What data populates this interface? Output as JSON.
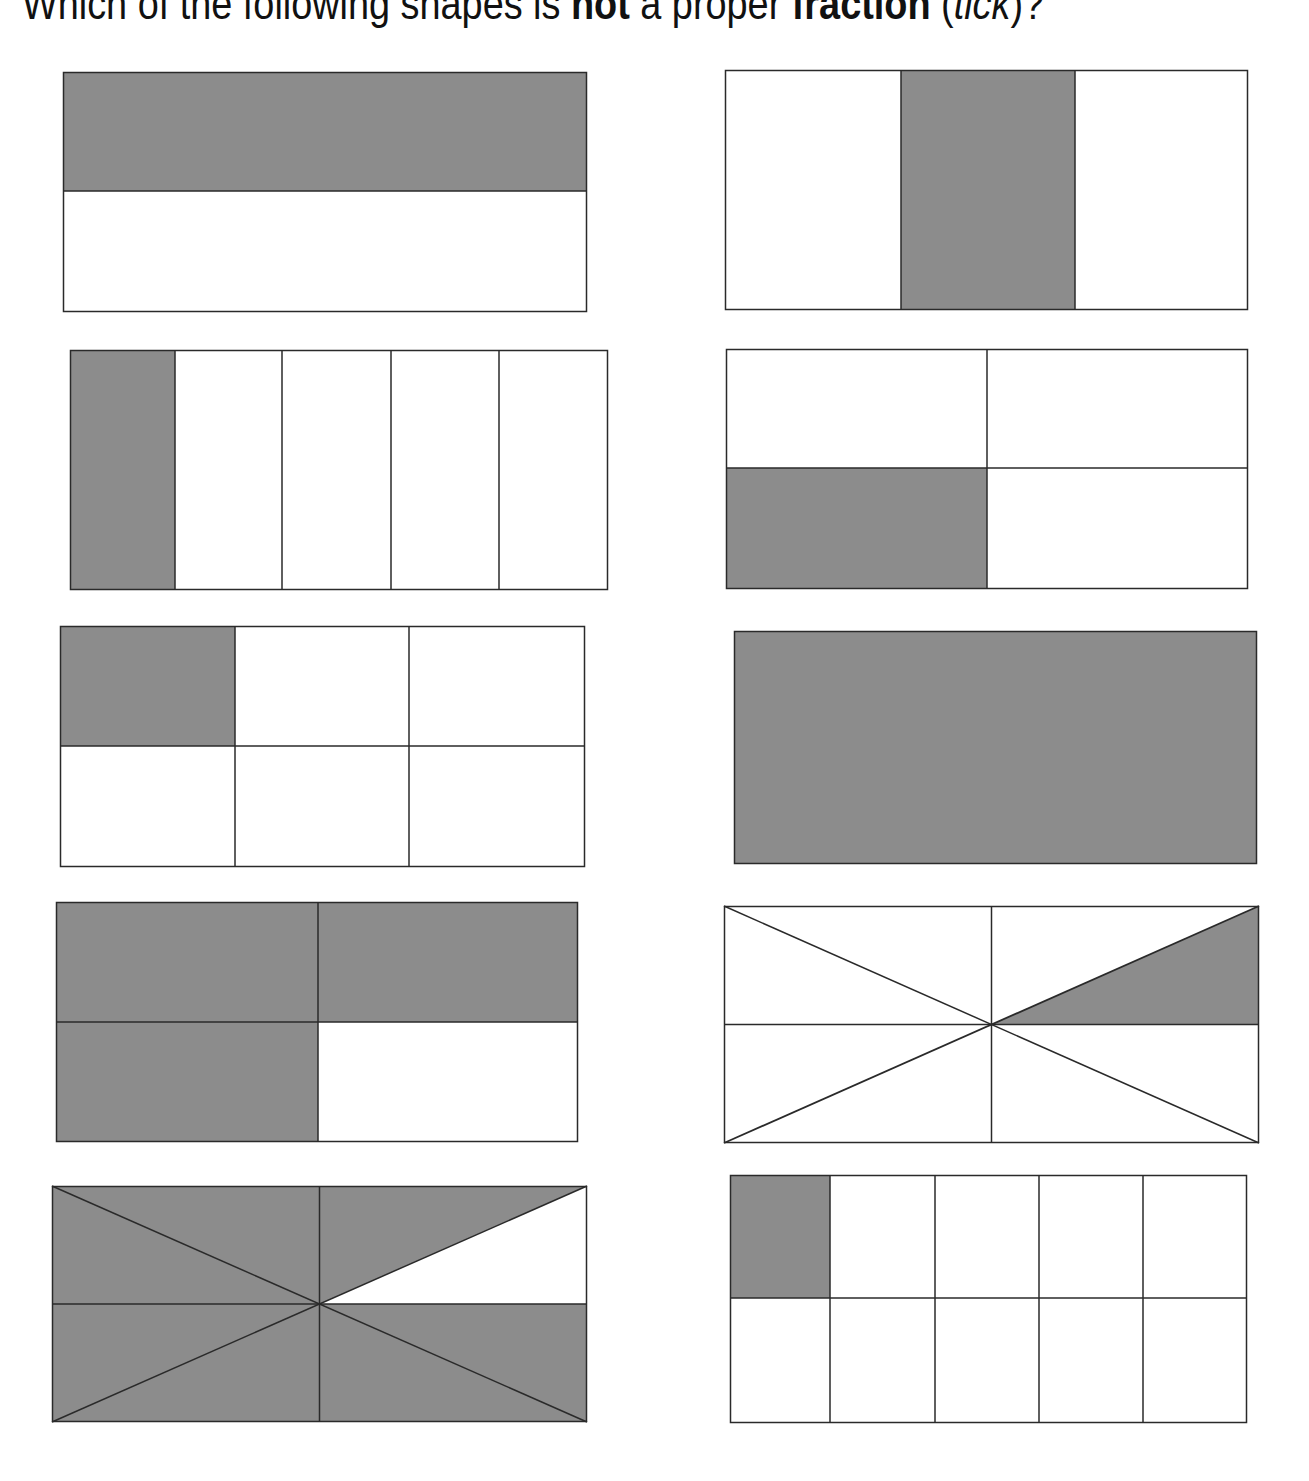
{
  "question": {
    "part1": "Which of the following shapes is ",
    "bold1": "not",
    "part2": " a proper ",
    "bold2": "fraction",
    "part3": " (",
    "italic": "tick",
    "part4": ")?"
  },
  "colors": {
    "shade": "#8c8c8c",
    "line": "#2a2a2a",
    "background": "#ffffff"
  },
  "shapes": [
    {
      "id": 1,
      "description": "rectangle split into 2 horizontal halves, top half shaded",
      "parts": 2,
      "shaded": 1,
      "fraction": "1/2"
    },
    {
      "id": 2,
      "description": "rectangle split into 3 vertical columns, middle shaded",
      "parts": 3,
      "shaded": 1,
      "fraction": "1/3"
    },
    {
      "id": 3,
      "description": "rectangle split into 5 vertical columns, first shaded",
      "parts": 5,
      "shaded": 1,
      "fraction": "1/5"
    },
    {
      "id": 4,
      "description": "2x2 grid, bottom-left cell shaded",
      "parts": 4,
      "shaded": 1,
      "fraction": "1/4"
    },
    {
      "id": 5,
      "description": "3x2 grid, top-left cell shaded",
      "parts": 6,
      "shaded": 1,
      "fraction": "1/6"
    },
    {
      "id": 6,
      "description": "whole rectangle shaded",
      "parts": 1,
      "shaded": 1,
      "fraction": "1/1"
    },
    {
      "id": 7,
      "description": "2x2 grid, three cells shaded",
      "parts": 4,
      "shaded": 3,
      "fraction": "3/4"
    },
    {
      "id": 8,
      "description": "rectangle divided into 8 triangles, one shaded",
      "parts": 8,
      "shaded": 1,
      "fraction": "1/8"
    },
    {
      "id": 9,
      "description": "rectangle divided into 8 triangles, seven shaded",
      "parts": 8,
      "shaded": 7,
      "fraction": "7/8"
    },
    {
      "id": 10,
      "description": "5x2 grid, top-left cell shaded",
      "parts": 10,
      "shaded": 1,
      "fraction": "1/10"
    }
  ]
}
